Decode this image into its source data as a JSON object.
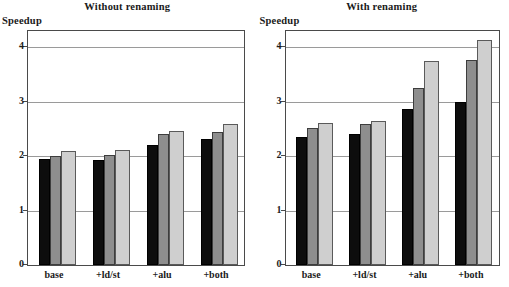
{
  "figure": {
    "ylabel": "Speedup",
    "panels": [
      {
        "title": "Without renaming"
      },
      {
        "title": "With renaming"
      }
    ]
  },
  "chart_data": [
    {
      "type": "bar",
      "title": "Without renaming",
      "xlabel": "",
      "ylabel": "Speedup",
      "ylim": [
        0,
        4.3
      ],
      "yticks": [
        0,
        1,
        2,
        3,
        4
      ],
      "ytick_labels": [
        "0",
        "1",
        "2",
        "3",
        "4"
      ],
      "grid": true,
      "legend": "none",
      "categories": [
        "base",
        "+ld/st",
        "+alu",
        "+both"
      ],
      "series": [
        {
          "name": "series-1",
          "color": "#0d0d0d",
          "values": [
            1.95,
            1.93,
            2.21,
            2.31
          ]
        },
        {
          "name": "series-2",
          "color": "#8e8e8e",
          "values": [
            2.01,
            2.02,
            2.4,
            2.44
          ]
        },
        {
          "name": "series-3",
          "color": "#cfcfcf",
          "values": [
            2.09,
            2.11,
            2.46,
            2.6
          ]
        }
      ]
    },
    {
      "type": "bar",
      "title": "With renaming",
      "xlabel": "",
      "ylabel": "Speedup",
      "ylim": [
        0,
        4.3
      ],
      "yticks": [
        0,
        1,
        2,
        3,
        4
      ],
      "ytick_labels": [
        "0",
        "1",
        "2",
        "3",
        "4"
      ],
      "grid": true,
      "legend": "none",
      "categories": [
        "base",
        "+ld/st",
        "+alu",
        "+both"
      ],
      "series": [
        {
          "name": "series-1",
          "color": "#0d0d0d",
          "values": [
            2.35,
            2.41,
            2.86,
            3.0
          ]
        },
        {
          "name": "series-2",
          "color": "#8e8e8e",
          "values": [
            2.52,
            2.6,
            3.26,
            3.77
          ]
        },
        {
          "name": "series-3",
          "color": "#cfcfcf",
          "values": [
            2.61,
            2.64,
            3.75,
            4.13
          ]
        }
      ]
    }
  ]
}
